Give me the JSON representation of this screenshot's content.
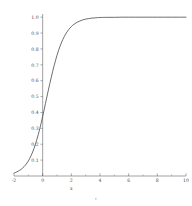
{
  "chart_data": {
    "type": "line",
    "title": "",
    "subtitle": "",
    "xlabel": "x",
    "ylabel": "",
    "xlim": [
      -2,
      10
    ],
    "ylim": [
      0,
      1.02
    ],
    "grid": false,
    "legend": null,
    "legend_position": "none",
    "xticks": [
      -2,
      0,
      2,
      4,
      6,
      8,
      10
    ],
    "xtick_labels": [
      "-2",
      "0",
      "2",
      "4",
      "6",
      "8",
      "10"
    ],
    "xminor_step": 1,
    "yticks": [
      0.1,
      0.2,
      0.3,
      0.4,
      0.5,
      0.6,
      0.7,
      0.8,
      0.9,
      1.0
    ],
    "ytick_labels": [
      "0.1",
      "0.2",
      "0.3",
      "0.4",
      "0.5",
      "0.6",
      "0.7",
      "0.8",
      "0.9",
      "1.0"
    ],
    "yaxis_at_x": 0,
    "xaxis_at_y": 0,
    "curve_color": "#3d3d3d",
    "axis_color": "#555555",
    "background": "#ffffff",
    "series": [
      {
        "name": "logistic",
        "x": [
          -2.0,
          -1.8,
          -1.6,
          -1.4,
          -1.2,
          -1.0,
          -0.8,
          -0.6,
          -0.4,
          -0.2,
          0.0,
          0.2,
          0.4,
          0.6,
          0.8,
          1.0,
          1.2,
          1.4,
          1.6,
          1.8,
          2.0,
          2.2,
          2.4,
          2.6,
          2.8,
          3.0,
          3.2,
          3.4,
          3.6,
          3.8,
          4.0,
          4.5,
          5.0,
          5.5,
          6.0,
          6.5,
          7.0,
          7.5,
          8.0,
          8.5,
          9.0,
          9.5,
          10.0
        ],
        "y": [
          0.018,
          0.026,
          0.036,
          0.05,
          0.069,
          0.095,
          0.13,
          0.174,
          0.231,
          0.298,
          0.375,
          0.458,
          0.542,
          0.622,
          0.695,
          0.76,
          0.814,
          0.858,
          0.893,
          0.92,
          0.941,
          0.956,
          0.968,
          0.976,
          0.983,
          0.988,
          0.991,
          0.994,
          0.995,
          0.997,
          0.998,
          0.999,
          0.999,
          1.0,
          1.0,
          1.0,
          1.0,
          1.0,
          1.0,
          1.0,
          1.0,
          1.0,
          1.0
        ]
      }
    ]
  }
}
